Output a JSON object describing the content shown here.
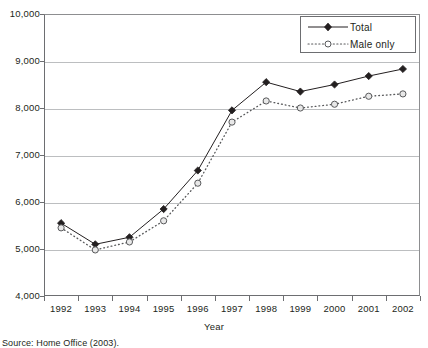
{
  "chart_data": {
    "type": "line",
    "title": "",
    "xlabel": "Year",
    "ylabel": "",
    "categories": [
      "1992",
      "1993",
      "1994",
      "1995",
      "1996",
      "1997",
      "1998",
      "1999",
      "2000",
      "2001",
      "2002"
    ],
    "series": [
      {
        "name": "Total",
        "marker": "filled-diamond",
        "line_style": "solid",
        "color": "#231f20",
        "values": [
          5550,
          5100,
          5250,
          5850,
          6670,
          7950,
          8550,
          8350,
          8500,
          8680,
          8830
        ]
      },
      {
        "name": "Male only",
        "marker": "open-circle",
        "line_style": "dotted",
        "color": "#58595b",
        "values": [
          5450,
          4980,
          5150,
          5600,
          6400,
          7700,
          8150,
          8000,
          8080,
          8250,
          8300
        ]
      }
    ],
    "ylim": [
      4000,
      10000
    ],
    "y_ticks": [
      "4,000",
      "5,000",
      "6,000",
      "7,000",
      "8,000",
      "9,000",
      "10,000"
    ],
    "y_tick_values": [
      4000,
      5000,
      6000,
      7000,
      8000,
      9000,
      10000
    ],
    "grid": true,
    "legend_position": "top-right"
  },
  "legend": {
    "entries": [
      {
        "label": "Total"
      },
      {
        "label": "Male only"
      }
    ]
  },
  "caption": {
    "source": "Source: Home Office (2003)."
  },
  "colors": {
    "total": "#231f20",
    "male_only": "#58595b",
    "grid": "#bcbec0",
    "axis": "#6d6e71"
  }
}
